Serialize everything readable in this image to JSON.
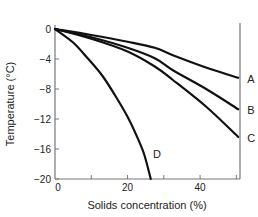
{
  "chart_data": {
    "type": "line",
    "title": "",
    "xlabel": "Solids concentration (%)",
    "ylabel": "Temperature (°C)",
    "xlim": [
      0,
      51
    ],
    "ylim": [
      -20,
      0
    ],
    "xticks": [
      0,
      10,
      20,
      30,
      40,
      50
    ],
    "xtick_labels": [
      "0",
      "",
      "20",
      "",
      "40",
      ""
    ],
    "yticks": [
      0,
      -4,
      -8,
      -12,
      -16,
      -20
    ],
    "ytick_labels": [
      "0",
      "−4",
      "−8",
      "−12",
      "−16",
      "−20"
    ],
    "grid": false,
    "legend": "inline labels at curve ends",
    "series": [
      {
        "name": "A",
        "x": [
          0,
          10,
          20,
          27.5,
          32.5,
          42,
          50.5
        ],
        "y": [
          0,
          -0.8,
          -1.7,
          -2.5,
          -3.5,
          -5.2,
          -6.5
        ]
      },
      {
        "name": "B",
        "x": [
          0,
          10,
          20,
          27.5,
          32.5,
          42,
          50.5
        ],
        "y": [
          0,
          -1.1,
          -2.5,
          -3.9,
          -5.5,
          -8.1,
          -10.7
        ]
      },
      {
        "name": "C",
        "x": [
          0,
          10,
          20,
          27.5,
          32.5,
          42,
          50.5
        ],
        "y": [
          0,
          -1.3,
          -3.0,
          -5.0,
          -6.8,
          -10.5,
          -14.4
        ]
      },
      {
        "name": "D",
        "x": [
          0,
          5,
          9,
          13,
          16.5,
          20,
          22,
          24.5,
          26.4
        ],
        "y": [
          0,
          -1.8,
          -3.9,
          -6.2,
          -8.8,
          -11.7,
          -13.7,
          -16.6,
          -20
        ]
      }
    ],
    "annotations": [
      {
        "text": "A",
        "x": 53,
        "y": -6.6
      },
      {
        "text": "B",
        "x": 53,
        "y": -10.8
      },
      {
        "text": "C",
        "x": 53,
        "y": -14.5
      },
      {
        "text": "D",
        "x": 27,
        "y": -16.6
      }
    ]
  },
  "colors": {
    "line": "#111111",
    "axis": "#777777",
    "text": "#222222"
  }
}
